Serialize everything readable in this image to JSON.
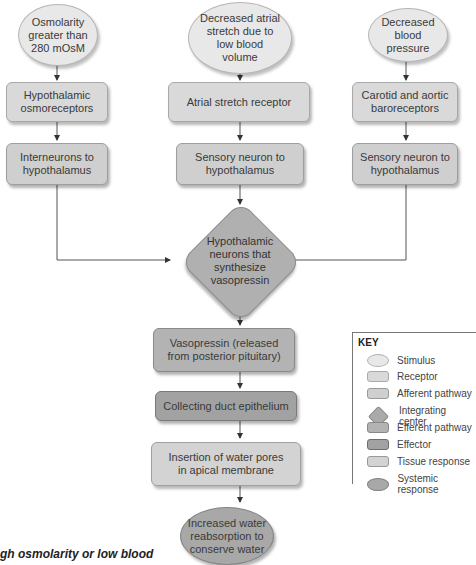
{
  "columns": {
    "left": {
      "stimulus": "Osmolarity greater than 280 mOsM",
      "receptor": "Hypothalamic osmoreceptors",
      "afferent": "Interneurons to hypothalamus"
    },
    "center": {
      "stimulus": "Decreased atrial stretch due to low blood volume",
      "receptor": "Atrial stretch receptor",
      "afferent": "Sensory neuron to hypothalamus"
    },
    "right": {
      "stimulus": "Decreased blood pressure",
      "receptor": "Carotid and aortic baroreceptors",
      "afferent": "Sensory neuron to hypothalamus"
    }
  },
  "integrating_center": "Hypothalamic neurons that synthesize vasopressin",
  "efferent": "Vasopressin (released from posterior pituitary)",
  "effector": "Collecting duct epithelium",
  "tissue_response": "Insertion of water pores in apical membrane",
  "systemic_response": "Increased water reabsorption to conserve water",
  "key": {
    "title": "KEY",
    "items": [
      {
        "shape": "oval-light",
        "label": "Stimulus"
      },
      {
        "shape": "rect-light",
        "label": "Receptor"
      },
      {
        "shape": "rect-light",
        "label": "Afferent pathway"
      },
      {
        "shape": "diamond",
        "label": "Integrating center"
      },
      {
        "shape": "rect-medium",
        "label": "Efferent pathway"
      },
      {
        "shape": "rect-dark",
        "label": "Effector"
      },
      {
        "shape": "rect-light",
        "label": "Tissue response"
      },
      {
        "shape": "oval-dark",
        "label": "Systemic response"
      }
    ]
  },
  "caption": "gh osmolarity or low blood",
  "colors": {
    "stimulus": "#e8e8e8",
    "receptor": "#d9d9d9",
    "afferent": "#cfcfcf",
    "integrating": "#b0b0b0",
    "efferent": "#b3b3b3",
    "effector": "#a2a2a2",
    "tissue": "#d3d3d3",
    "systemic": "#a8a8a8",
    "line": "#555555"
  }
}
